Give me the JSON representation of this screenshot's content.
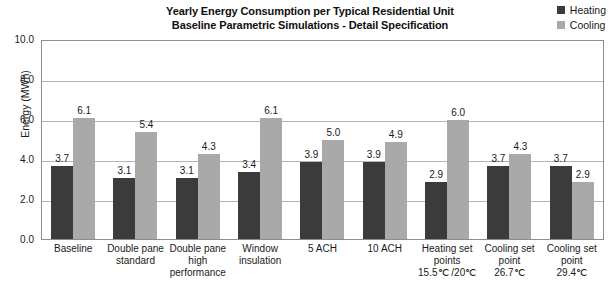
{
  "chart_data": {
    "type": "bar",
    "title": "Yearly Energy Consumption per Typical Residential Unit",
    "subtitle": "Baseline Parametric Simulations - Detail Specification",
    "xlabel": "",
    "ylabel": "Energy (MWh)",
    "ylim": [
      0,
      10
    ],
    "ytick_labels": [
      "0.0",
      "2.0",
      "4.0",
      "6.0",
      "8.0",
      "10.0"
    ],
    "ytick_values": [
      0,
      2,
      4,
      6,
      8,
      10
    ],
    "grid": true,
    "legend_position": "top-right",
    "categories": [
      "Baseline",
      "Double pane standard",
      "Double pane high performance",
      "Window insulation",
      "5 ACH",
      "10 ACH",
      "Heating set points 15.5℃ /20℃",
      "Cooling set point 26.7℃",
      "Cooling set point 29.4℃"
    ],
    "category_lines": [
      [
        "Baseline"
      ],
      [
        "Double pane",
        "standard"
      ],
      [
        "Double pane",
        "high",
        "performance"
      ],
      [
        "Window",
        "insulation"
      ],
      [
        "5 ACH"
      ],
      [
        "10 ACH"
      ],
      [
        "Heating set",
        "points",
        "15.5℃ /20℃"
      ],
      [
        "Cooling set",
        "point",
        "26.7℃"
      ],
      [
        "Cooling set",
        "point",
        "29.4℃"
      ]
    ],
    "series": [
      {
        "name": "Heating",
        "color": "#3b3b3b",
        "values": [
          3.7,
          3.1,
          3.1,
          3.4,
          3.9,
          3.9,
          2.9,
          3.7,
          3.7
        ],
        "labels": [
          "3.7",
          "3.1",
          "3.1",
          "3.4",
          "3.9",
          "3.9",
          "2.9",
          "3.7",
          "3.7"
        ]
      },
      {
        "name": "Cooling",
        "color": "#a9a9a9",
        "values": [
          6.1,
          5.4,
          4.3,
          6.1,
          5.0,
          4.9,
          6.0,
          4.3,
          2.9
        ],
        "labels": [
          "6.1",
          "5.4",
          "4.3",
          "6.1",
          "5.0",
          "4.9",
          "6.0",
          "4.3",
          "2.9"
        ]
      }
    ]
  }
}
